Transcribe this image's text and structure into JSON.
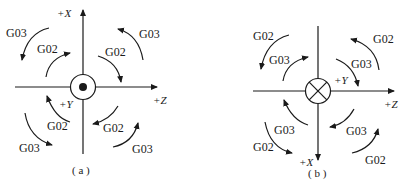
{
  "figure_a": {
    "caption": "( a )",
    "axis_x": "+X",
    "axis_z": "+Z",
    "axis_y": "+Y",
    "center_symbol": "dot-in-circle (axis pointing out of page)",
    "labels": {
      "top_left_outer": "G03",
      "top_left_inner": "G02",
      "top_right_inner": "G02",
      "top_right_outer": "G03",
      "bottom_left_inner": "G02",
      "bottom_left_outer": "G03",
      "bottom_right_inner": "G02",
      "bottom_right_outer": "G03"
    }
  },
  "figure_b": {
    "caption": "( b )",
    "axis_x": "+X",
    "axis_z": "+Z",
    "axis_y": "+Y",
    "center_symbol": "cross-in-circle (axis pointing into page)",
    "labels": {
      "top_left_outer": "G02",
      "top_left_inner": "G03",
      "top_right_inner": "G03",
      "top_right_outer": "G02",
      "bottom_left_inner": "G03",
      "bottom_left_outer": "G02",
      "bottom_right_inner": "G03",
      "bottom_right_outer": "G02"
    }
  }
}
